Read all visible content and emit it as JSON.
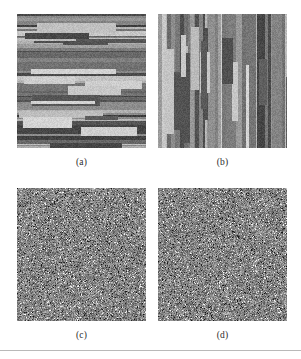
{
  "figure": {
    "background_color": "#ffffff",
    "rule_color": "#b9b9b9",
    "panels": [
      {
        "id": "a",
        "caption": "(a)",
        "texture": "horizontal-bands",
        "description": "grayscale horizontal stripe texture",
        "base_gray": "#8a8a8a",
        "seed": 1427
      },
      {
        "id": "b",
        "caption": "(b)",
        "texture": "vertical-bands",
        "description": "grayscale vertical stripe texture",
        "base_gray": "#8a8a8a",
        "seed": 8821
      },
      {
        "id": "c",
        "caption": "(c)",
        "texture": "random-noise",
        "description": "grayscale random noise texture",
        "base_gray": "#8e8e8e",
        "seed": 3344
      },
      {
        "id": "d",
        "caption": "(d)",
        "texture": "random-noise",
        "description": "grayscale random noise texture",
        "base_gray": "#8e8e8e",
        "seed": 6195
      }
    ]
  }
}
